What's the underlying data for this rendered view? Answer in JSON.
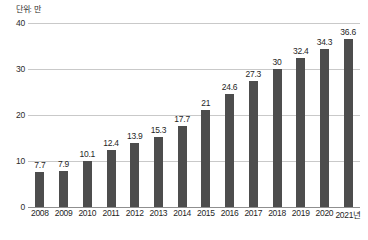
{
  "chart_data": {
    "type": "bar",
    "title": "",
    "subtitle": "",
    "unit_label": "단위: 만",
    "xlabel": "",
    "ylabel": "",
    "categories": [
      "2008",
      "2009",
      "2010",
      "2011",
      "2012",
      "2013",
      "2014",
      "2015",
      "2016",
      "2017",
      "2018",
      "2019",
      "2020",
      "2021년"
    ],
    "values": [
      7.7,
      7.9,
      10.1,
      12.4,
      13.9,
      15.3,
      17.7,
      21,
      24.6,
      27.3,
      30,
      32.4,
      34.3,
      36.6
    ],
    "value_labels": [
      "7.7",
      "7.9",
      "10.1",
      "12.4",
      "13.9",
      "15.3",
      "17.7",
      "21",
      "24.6",
      "27.3",
      "30",
      "32.4",
      "34.3",
      "36.6"
    ],
    "ylim": [
      0,
      40
    ],
    "yticks": [
      0,
      10,
      20,
      30,
      40
    ],
    "ytick_labels": [
      "0",
      "10",
      "20",
      "30",
      "40"
    ],
    "grid": true,
    "legend": null,
    "series": [
      {
        "name": "",
        "values": [
          7.7,
          7.9,
          10.1,
          12.4,
          13.9,
          15.3,
          17.7,
          21,
          24.6,
          27.3,
          30,
          32.4,
          34.3,
          36.6
        ],
        "color": "#4d4d4d"
      }
    ],
    "colors": {
      "bar": "#4d4d4d",
      "gridline": "#c9c9c9",
      "baseline": "#8f8f8f",
      "text": "#1f1f1f",
      "background": "#ffffff"
    }
  }
}
